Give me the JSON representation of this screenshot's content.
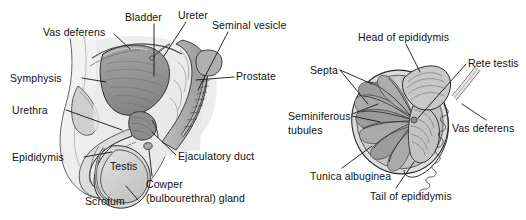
{
  "figure": {
    "background_color": "#ffffff",
    "line_color": "#1a1a1a",
    "fill_light": "#d8d8d8",
    "fill_mid": "#b4b4b4",
    "fill_dark": "#8f8f8f",
    "panels": [
      {
        "id": "sagittal-male-pelvis",
        "name": "Sagittal section of male pelvis",
        "labels": [
          "Vas deferens",
          "Bladder",
          "Ureter",
          "Seminal vesicle",
          "Prostate",
          "Symphysis",
          "Urethra",
          "Epididymis",
          "Testis",
          "Scrotum",
          "Ejaculatory duct",
          "Cowper (bulbourethral) gland"
        ]
      },
      {
        "id": "testis-cross-section",
        "name": "Cross section of testis and epididymis",
        "labels": [
          "Head of epididymis",
          "Septa",
          "Rete testis",
          "Seminiferous tubules",
          "Vas deferens",
          "Tunica albuginea",
          "Tail of epididymis"
        ]
      }
    ]
  },
  "left_diagram": {
    "vas_deferens": "Vas deferens",
    "bladder": "Bladder",
    "ureter": "Ureter",
    "seminal_vesicle": "Seminal vesicle",
    "prostate": "Prostate",
    "symphysis": "Symphysis",
    "urethra": "Urethra",
    "epididymis": "Epididymis",
    "testis": "Testis",
    "scrotum": "Scrotum",
    "ejaculatory_duct": "Ejaculatory duct",
    "cowper_line1": "Cowper",
    "cowper_line2": "(bulbourethral) gland"
  },
  "right_diagram": {
    "head_of_epididymis": "Head of epididymis",
    "septa": "Septa",
    "rete_testis": "Rete testis",
    "seminiferous_line1": "Seminiferous",
    "seminiferous_line2": "tubules",
    "vas_deferens": "Vas deferens",
    "tunica_albuginea": "Tunica albuginea",
    "tail_of_epididymis": "Tail of epididymis"
  }
}
